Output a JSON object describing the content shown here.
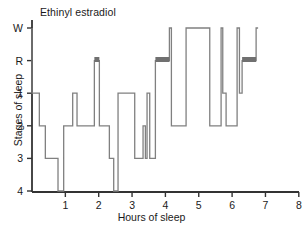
{
  "chart_data": {
    "type": "line",
    "title": "Ethinyl estradiol",
    "xlabel": "Hours of sleep",
    "ylabel": "Stages of sleep",
    "xlim": [
      0,
      8
    ],
    "xticks": [
      1,
      2,
      3,
      4,
      5,
      6,
      7,
      8
    ],
    "xtick_labels": [
      "1",
      "2",
      "3",
      "4",
      "5",
      "6",
      "7",
      "8"
    ],
    "yticks": [
      "W",
      "R",
      "1",
      "2",
      "3",
      "4"
    ],
    "ytick_labels": [
      "W",
      "R",
      "1",
      "2",
      "3",
      "4"
    ],
    "y_levels": {
      "W": 0,
      "R": 1,
      "1": 2,
      "2": 3,
      "3": 4,
      "4": 5
    },
    "grid": false,
    "legend": false,
    "line_color": "#808080",
    "rem_bar_color": "#707070",
    "axis_color": "#333333",
    "series": [
      {
        "name": "sleep stage hypnogram",
        "step": "post",
        "points": [
          {
            "x": 0.0,
            "stage": "W"
          },
          {
            "x": 0.0,
            "stage": "1"
          },
          {
            "x": 0.22,
            "stage": "2"
          },
          {
            "x": 0.4,
            "stage": "3"
          },
          {
            "x": 0.78,
            "stage": "4"
          },
          {
            "x": 0.95,
            "stage": "2"
          },
          {
            "x": 1.22,
            "stage": "1"
          },
          {
            "x": 1.35,
            "stage": "2"
          },
          {
            "x": 1.87,
            "stage": "R"
          },
          {
            "x": 2.02,
            "stage": "2"
          },
          {
            "x": 2.32,
            "stage": "3"
          },
          {
            "x": 2.45,
            "stage": "4"
          },
          {
            "x": 2.58,
            "stage": "1"
          },
          {
            "x": 3.08,
            "stage": "3"
          },
          {
            "x": 3.33,
            "stage": "2"
          },
          {
            "x": 3.4,
            "stage": "3"
          },
          {
            "x": 3.45,
            "stage": "1"
          },
          {
            "x": 3.53,
            "stage": "3"
          },
          {
            "x": 3.7,
            "stage": "R"
          },
          {
            "x": 4.12,
            "stage": "W"
          },
          {
            "x": 4.18,
            "stage": "2"
          },
          {
            "x": 4.62,
            "stage": "W"
          },
          {
            "x": 5.33,
            "stage": "2"
          },
          {
            "x": 5.67,
            "stage": "W"
          },
          {
            "x": 5.72,
            "stage": "1"
          },
          {
            "x": 5.82,
            "stage": "2"
          },
          {
            "x": 6.15,
            "stage": "W"
          },
          {
            "x": 6.22,
            "stage": "1"
          },
          {
            "x": 6.3,
            "stage": "R"
          },
          {
            "x": 6.72,
            "stage": "W"
          },
          {
            "x": 6.78,
            "stage": "W"
          }
        ]
      }
    ],
    "rem_bars": [
      {
        "start": 1.87,
        "end": 2.02,
        "stage": "R"
      },
      {
        "start": 3.7,
        "end": 4.12,
        "stage": "R"
      },
      {
        "start": 6.3,
        "end": 6.72,
        "stage": "R"
      }
    ]
  }
}
